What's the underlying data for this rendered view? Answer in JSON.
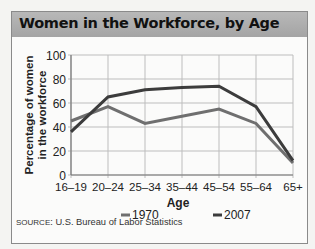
{
  "header": {
    "title": "Women in the Workforce, by Age"
  },
  "source": {
    "prefix": "SOURCE",
    "text": ": U.S. Bureau of Labor Statistics"
  },
  "colors": {
    "series_1970": "#6f6f6f",
    "series_2007": "#3c3c3c",
    "grid": "#bdbdbd",
    "axis": "#777777"
  },
  "chart_data": {
    "type": "line",
    "title": "Women in the Workforce, by Age",
    "xlabel": "Age",
    "ylabel": "Percentage of women in the workforce",
    "categories": [
      "16–19",
      "20–24",
      "25–34",
      "35–44",
      "45–54",
      "55–64",
      "65+"
    ],
    "yticks": [
      0,
      20,
      40,
      60,
      80,
      100
    ],
    "ylim": [
      0,
      100
    ],
    "grid": true,
    "legend_position": "bottom",
    "series": [
      {
        "name": "1970",
        "values": [
          45,
          57,
          43,
          49,
          55,
          43,
          10
        ]
      },
      {
        "name": "2007",
        "values": [
          36,
          65,
          71,
          73,
          74,
          57,
          12
        ]
      }
    ]
  }
}
